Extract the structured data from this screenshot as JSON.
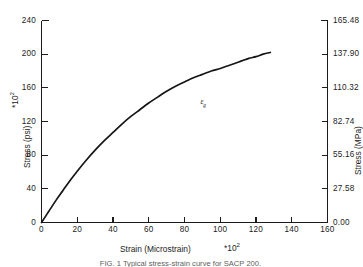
{
  "chart_data": {
    "type": "line",
    "title": "",
    "xlabel": "Strain (Microstrain)",
    "xlabel_multiplier": "*10",
    "xlabel_exponent": "2",
    "ylabel_left": "Stress (psi)",
    "ylabel_left_multiplier": "*10",
    "ylabel_left_exponent": "2",
    "ylabel_right": "Stress (MPa)",
    "xlim": [
      0,
      160
    ],
    "ylim_left": [
      0,
      240
    ],
    "ylim_right": [
      0.0,
      165.48
    ],
    "grid": false,
    "legend": "none",
    "x_ticks": [
      "0",
      "20",
      "40",
      "60",
      "80",
      "100",
      "120",
      "140",
      "160"
    ],
    "x_tick_values": [
      0,
      20,
      40,
      60,
      80,
      100,
      120,
      140,
      160
    ],
    "y_left_ticks": [
      "0",
      "40",
      "80",
      "120",
      "160",
      "200",
      "240"
    ],
    "y_left_tick_values": [
      0,
      40,
      80,
      120,
      160,
      200,
      240
    ],
    "y_right_ticks": [
      "0.00",
      "27.58",
      "55.16",
      "82.74",
      "110.32",
      "137.90",
      "165.48"
    ],
    "y_right_tick_values": [
      0.0,
      27.58,
      55.16,
      82.74,
      110.32,
      137.9,
      165.48
    ],
    "series": [
      {
        "name": "stress-strain curve",
        "x": [
          0,
          4,
          8,
          12,
          16,
          20,
          25,
          30,
          35,
          40,
          45,
          50,
          55,
          60,
          65,
          70,
          75,
          80,
          85,
          90,
          95,
          100,
          104,
          108,
          112,
          116,
          120,
          124,
          128
        ],
        "y": [
          0,
          13,
          26,
          38,
          50,
          61,
          74,
          86,
          97,
          107,
          117,
          126,
          134,
          142,
          149,
          156,
          162,
          167,
          172,
          176,
          180,
          183,
          186,
          189,
          192,
          195,
          197,
          200,
          202
        ]
      }
    ],
    "annotations": [
      {
        "name": "yield-strain-marker",
        "symbol": "ε",
        "subscript": "g",
        "x": 90,
        "y": 145
      }
    ]
  },
  "caption": {
    "text": "FIG. 1 Typical stress-strain curve for SACP 200."
  }
}
